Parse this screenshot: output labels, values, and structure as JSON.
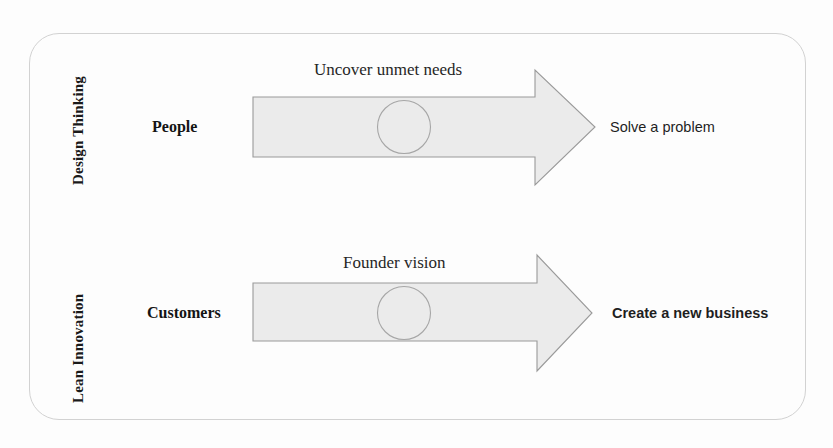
{
  "diagram": {
    "title_present": false,
    "frame": {
      "border_color": "#d2d2d2"
    },
    "arrow_fill": "#ebebeb",
    "arrow_stroke": "#9a9a9a",
    "rows": [
      {
        "id": "design-thinking",
        "section_label": "Design Thinking",
        "source": "People",
        "caption": "Uncover unmet needs",
        "outcome": "Solve a problem",
        "outcome_weight": "normal"
      },
      {
        "id": "lean-innovation",
        "section_label": "Lean Innovation",
        "source": "Customers",
        "caption": "Founder vision",
        "outcome": "Create a new business",
        "outcome_weight": "bold"
      }
    ]
  }
}
